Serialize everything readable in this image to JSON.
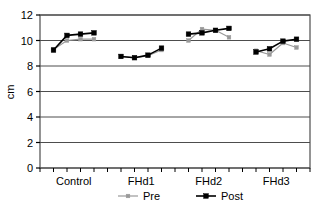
{
  "chart_data": {
    "type": "line",
    "title": "",
    "xlabel": "",
    "ylabel": "cm",
    "ylim": [
      0,
      12
    ],
    "ytick_labels": [
      "0",
      "2",
      "4",
      "6",
      "8",
      "10",
      "12"
    ],
    "yticks": [
      0,
      2,
      4,
      6,
      8,
      10,
      12
    ],
    "grid": true,
    "grid_axis": "y",
    "categories": [
      "Control",
      "FHd1",
      "FHd2",
      "FHd3"
    ],
    "legend": {
      "position": "bottom",
      "entries": [
        {
          "name": "Pre",
          "color": "#999999",
          "marker": "square"
        },
        {
          "name": "Post",
          "color": "#000000",
          "marker": "square"
        }
      ]
    },
    "groups": [
      {
        "category": "Control",
        "x": [
          1,
          2,
          3,
          4
        ],
        "series": [
          {
            "name": "Pre",
            "values": [
              9.3,
              10.0,
              10.1,
              10.1
            ]
          },
          {
            "name": "Post",
            "values": [
              9.25,
              10.4,
              10.5,
              10.6
            ]
          }
        ]
      },
      {
        "category": "FHd1",
        "x": [
          6,
          7,
          8,
          9
        ],
        "series": [
          {
            "name": "Pre",
            "values": [
              8.75,
              8.65,
              8.8,
              9.25
            ]
          },
          {
            "name": "Post",
            "values": [
              8.75,
              8.65,
              8.85,
              9.4
            ]
          }
        ]
      },
      {
        "category": "FHd2",
        "x": [
          11,
          12,
          13,
          14
        ],
        "series": [
          {
            "name": "Pre",
            "values": [
              10.0,
              10.9,
              10.8,
              10.25
            ]
          },
          {
            "name": "Post",
            "values": [
              10.5,
              10.6,
              10.8,
              10.95
            ]
          }
        ]
      },
      {
        "category": "FHd3",
        "x": [
          16,
          17,
          18,
          19
        ],
        "series": [
          {
            "name": "Pre",
            "values": [
              9.2,
              8.9,
              9.8,
              9.45
            ]
          },
          {
            "name": "Post",
            "values": [
              9.1,
              9.35,
              9.95,
              10.1
            ]
          }
        ]
      }
    ]
  },
  "axis": {
    "y_title": "cm"
  },
  "legend_items": [
    {
      "label": "Pre"
    },
    {
      "label": "Post"
    }
  ]
}
